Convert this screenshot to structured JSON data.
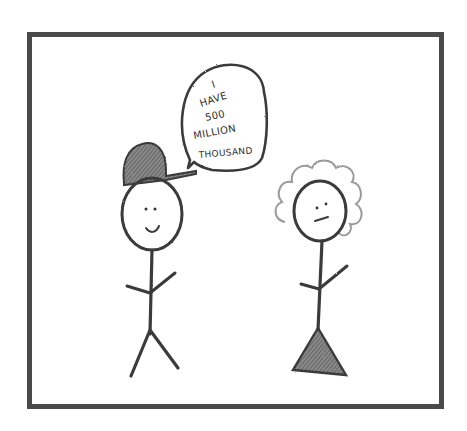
{
  "comic": {
    "panel_count": 1,
    "speech_bubble": {
      "speaker": "stick-figure-with-cap",
      "lines": [
        "I",
        "HAVE",
        "500",
        "MILLION",
        "THOUSAND"
      ]
    },
    "characters": [
      {
        "name": "boy",
        "features": [
          "cap-icon",
          "smile-face-icon",
          "stick-body",
          "legs"
        ]
      },
      {
        "name": "girl",
        "features": [
          "curly-hair-icon",
          "neutral-face-icon",
          "stick-body",
          "triangle-dress"
        ]
      }
    ],
    "colors": {
      "frame": "#4a4a4a",
      "pencil": "#3a3a3a",
      "shading": "#6e6e6e",
      "hair": "#9a9a9a",
      "background": "#ffffff"
    }
  }
}
